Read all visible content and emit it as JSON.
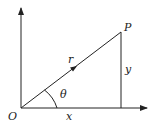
{
  "diagram": {
    "type": "polar-coordinates",
    "labels": {
      "origin": "O",
      "point": "P",
      "radius": "r",
      "angle": "θ",
      "x": "x",
      "y": "y"
    },
    "colors": {
      "stroke": "#222222",
      "background": "#ffffff"
    }
  }
}
